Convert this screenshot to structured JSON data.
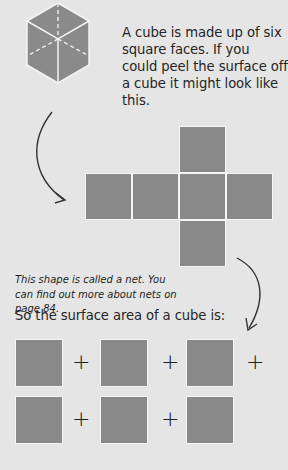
{
  "intro_text": "A cube is made up of six square faces. If you could peel the surface off a cube it might look like this.",
  "net_note": "This shape is called a net. You can find out more about nets on page 84.",
  "surface_area_text": "So the surface area of a cube is:",
  "plus_sign": "+",
  "colors": {
    "background": "#e5e5e5",
    "face": "#898989",
    "edge": "#f6f6f6",
    "arrow": "#333333"
  },
  "net_faces": 6,
  "sum_faces": 6
}
